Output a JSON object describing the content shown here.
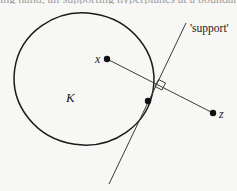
{
  "figure": {
    "cut_text_above": "ing hand, all supporting hyperplanes at a boundary point (1) of (1)",
    "labels": {
      "body": "K",
      "point_x": "x",
      "point_z": "z",
      "support_line": "'support'"
    },
    "colors": {
      "ink": "#1a1a1a",
      "thin_line": "#3a3a3a",
      "background": "#f7f7f5"
    },
    "geometry": {
      "body_ellipse": {
        "cx": 84,
        "cy": 79,
        "rx": 70,
        "ry": 66
      },
      "point_x": [
        107,
        59
      ],
      "point_z": [
        213,
        113
      ],
      "tangent_point": [
        148,
        101
      ],
      "support_line": [
        [
          186,
          23
        ],
        [
          109,
          184
        ]
      ],
      "right_angle_marker": [
        160,
        82
      ]
    }
  }
}
